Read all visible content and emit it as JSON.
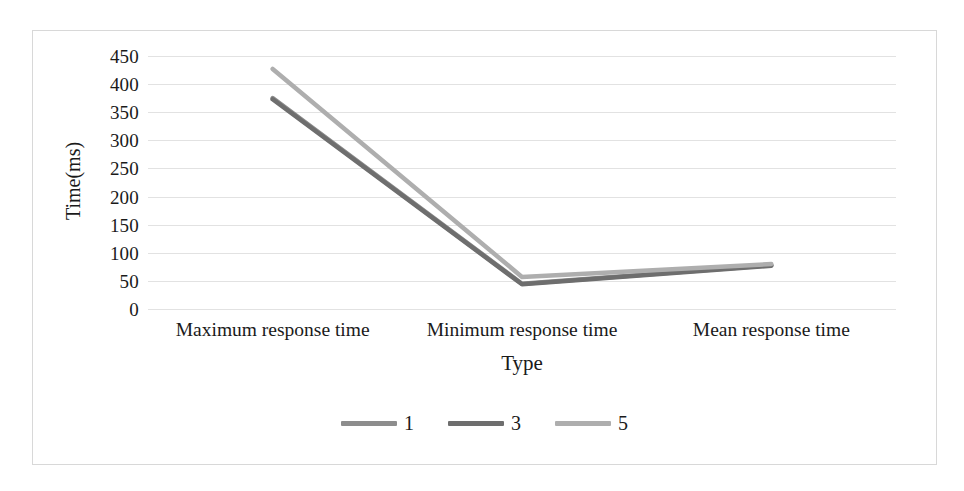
{
  "chart_data": {
    "type": "line",
    "title": "",
    "xlabel": "Type",
    "ylabel": "Time(ms)",
    "categories": [
      "Maximum response time",
      "Minimum response time",
      "Mean response time"
    ],
    "ylim": [
      0,
      450
    ],
    "yticks": [
      450,
      400,
      350,
      300,
      250,
      200,
      150,
      100,
      50,
      0
    ],
    "grid": true,
    "legend_position": "bottom",
    "series": [
      {
        "name": "1",
        "values": [
          375,
          45,
          78
        ],
        "color": "#8d8d8d"
      },
      {
        "name": "3",
        "values": [
          373,
          44,
          77
        ],
        "color": "#6e6e6e"
      },
      {
        "name": "5",
        "values": [
          427,
          57,
          80
        ],
        "color": "#aeaeae"
      }
    ]
  },
  "legend": {
    "items": [
      {
        "label": "1",
        "color": "#8d8d8d"
      },
      {
        "label": "3",
        "color": "#6e6e6e"
      },
      {
        "label": "5",
        "color": "#aeaeae"
      }
    ]
  }
}
